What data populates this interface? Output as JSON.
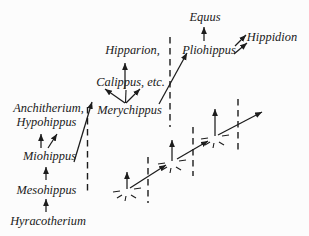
{
  "labels": {
    "equus": "Equus",
    "hippidion": "Hippidion",
    "pliohippus": "Pliohippus",
    "hipparion": "Hipparion,",
    "calippus": "Calippus, etc.",
    "merychippus": "Merychippus",
    "anchitherium": "Anchitherium,",
    "hypohippus": "Hypohippus",
    "miohippus": "Miohippus",
    "mesohippus": "Mesohippus",
    "hyracotherium": "Hyracotherium"
  },
  "colors": {
    "background": "#fcfcfc",
    "ink": "#1c1c1c",
    "text": "#212121"
  }
}
